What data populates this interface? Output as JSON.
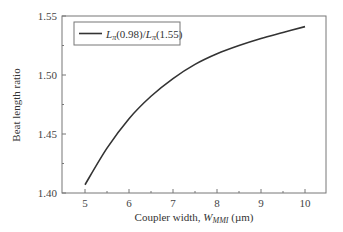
{
  "chart_data": {
    "type": "line",
    "title": "",
    "xlabel": "Coupler width, W_MMI (µm)",
    "xlabel_parts": {
      "prefix": "Coupler width, ",
      "var": "W",
      "sub": "MMI",
      "suffix": " (µm)"
    },
    "ylabel": "Beat length ratio",
    "xlim": [
      4.45,
      10.48
    ],
    "ylim": [
      1.4,
      1.55
    ],
    "xticks": [
      5,
      6,
      7,
      8,
      9,
      10
    ],
    "yticks": [
      1.4,
      1.45,
      1.5,
      1.55
    ],
    "xtick_labels": [
      "5",
      "6",
      "7",
      "8",
      "9",
      "10"
    ],
    "ytick_labels": [
      "1.40",
      "1.45",
      "1.50",
      "1.55"
    ],
    "grid": false,
    "legend_position": "upper left",
    "series": [
      {
        "name": "Lπ(0.98)/Lπ(1.55)",
        "color": "#333333",
        "x": [
          5.0,
          5.5,
          6.0,
          6.5,
          7.0,
          7.5,
          8.0,
          8.5,
          9.0,
          9.5,
          10.0
        ],
        "y": [
          1.407,
          1.438,
          1.463,
          1.482,
          1.497,
          1.509,
          1.518,
          1.525,
          1.531,
          1.536,
          1.541
        ]
      }
    ]
  },
  "legend": {
    "label_parts": {
      "L1": "L",
      "sub1": "π",
      "arg1": "(0.98)/",
      "L2": "L",
      "sub2": "π",
      "arg2": "(1.55)"
    }
  }
}
